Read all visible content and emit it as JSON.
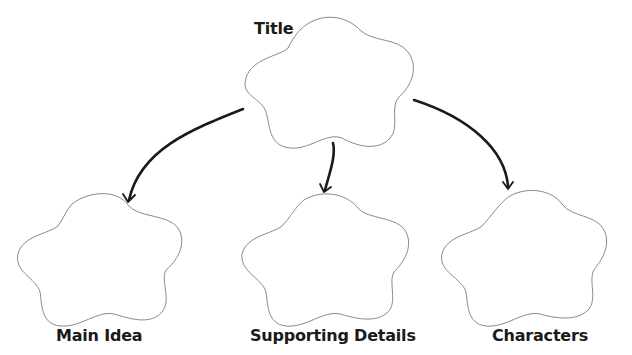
{
  "diagram": {
    "type": "graphic-organizer",
    "nodes": [
      {
        "id": "title",
        "label": "Title",
        "shape": "cloud"
      },
      {
        "id": "main_idea",
        "label": "Main Idea",
        "shape": "cloud"
      },
      {
        "id": "supporting_details",
        "label": "Supporting Details",
        "shape": "cloud"
      },
      {
        "id": "characters",
        "label": "Characters",
        "shape": "cloud"
      }
    ],
    "edges": [
      {
        "from": "title",
        "to": "main_idea"
      },
      {
        "from": "title",
        "to": "supporting_details"
      },
      {
        "from": "title",
        "to": "characters"
      }
    ]
  },
  "labels": {
    "title": "Title",
    "main_idea": "Main Idea",
    "supporting_details": "Supporting Details",
    "characters": "Characters"
  },
  "colors": {
    "outline": "#8a8a8a",
    "arrow": "#1a1a1a",
    "text": "#1a1a1a",
    "background": "#ffffff"
  }
}
